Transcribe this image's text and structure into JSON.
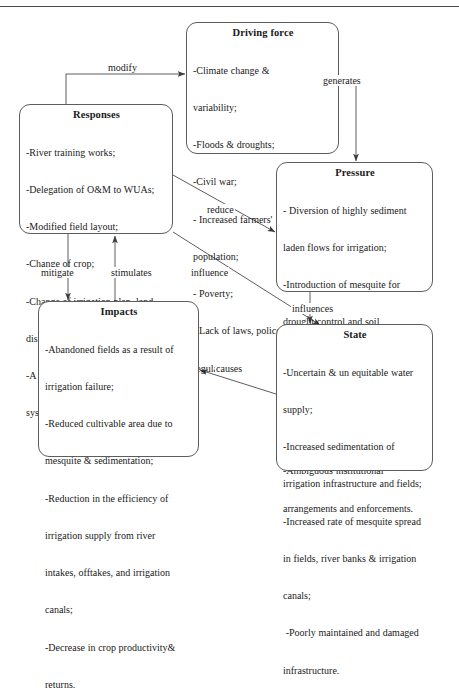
{
  "diagram": {
    "type": "flow-diagram",
    "border_color": "#5d5d5d",
    "text_color": "#1a1a1a",
    "background": "#ffffff"
  },
  "nodes": {
    "driving_force": {
      "title": "Driving force",
      "items": [
        "-Climate change &",
        "variability;",
        "-Floods & droughts;",
        "-Civil war;",
        "- Increased farmers'",
        "population;",
        "- Poverty;",
        "- Lack of laws, polices and",
        "regulations."
      ]
    },
    "responses": {
      "title": "Responses",
      "items": [
        "-River training works;",
        "-Delegation of O&M to WUAs;",
        "-Modified field layout;",
        "-Change of crop;",
        "-Change of irrigation plan, land",
        "distribution & tenancy agreement;",
        "-A fixed rate of water pricing",
        "system."
      ]
    },
    "pressure": {
      "title": "Pressure",
      "items": [
        "- Diversion of highly sediment",
        "laden flows for irrigation;",
        "-Introduction of mesquite for",
        "drought control and soil",
        "stabilization;",
        "-Sub-optimal decisions on intake",
        "operation;",
        "-Ambiguous institutional",
        "arrangements and enforcements."
      ]
    },
    "impacts": {
      "title": "Impacts",
      "items": [
        "-Abandoned fields as a result of",
        "irrigation failure;",
        "-Reduced cultivable area due to",
        "mesquite & sedimentation;",
        "-Reduction in the efficiency of",
        "irrigation supply from river",
        "intakes, offtakes, and irrigation",
        "canals;",
        "-Decrease in crop productivity&",
        "returns."
      ]
    },
    "state": {
      "title": "State",
      "items": [
        "-Uncertain & un equitable water",
        "supply;",
        "-Increased sedimentation of",
        "irrigation infrastructure and fields;",
        "-Increased rate of mesquite spread",
        "in fields, river banks & irrigation",
        "canals;",
        " -Poorly maintained and damaged",
        "infrastructure."
      ]
    }
  },
  "edges": {
    "modify": {
      "label": "modify",
      "from": "responses",
      "to": "driving_force"
    },
    "generates": {
      "label": "generates",
      "from": "driving_force",
      "to": "pressure"
    },
    "reduce": {
      "label": "reduce",
      "from": "responses",
      "to": "pressure"
    },
    "mitigate": {
      "label": "mitigate",
      "from": "responses",
      "to": "impacts"
    },
    "stimulates": {
      "label": "stimulates",
      "from": "impacts",
      "to": "responses"
    },
    "influence": {
      "label": "influence",
      "from": "responses",
      "to": "state"
    },
    "influences": {
      "label": "influences",
      "from": "pressure",
      "to": "state"
    },
    "causes": {
      "label": "causes",
      "from": "state",
      "to": "impacts"
    }
  }
}
